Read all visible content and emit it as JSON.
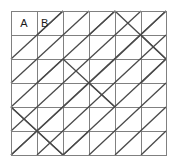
{
  "figure": {
    "kind": "geometric-grid-diagram",
    "background_color": "#ffffff",
    "grid": {
      "columns": 6,
      "rows": 6,
      "x_positions": [
        11,
        37,
        63,
        89,
        115,
        141,
        166
      ],
      "y_positions": [
        11,
        35,
        59,
        83,
        107,
        131,
        155
      ],
      "line_color": "#808080",
      "line_width": 1,
      "border_color": "#808080",
      "border_width": 1
    },
    "diagonals": {
      "line_color": "#4a4a4a",
      "line_width": 1.3,
      "segments": [
        [
          1,
          1,
          2,
          0
        ],
        [
          0,
          2,
          2,
          0
        ],
        [
          0,
          3,
          3,
          0
        ],
        [
          0,
          4,
          4,
          0
        ],
        [
          0,
          5,
          5,
          0
        ],
        [
          0,
          6,
          6,
          0
        ],
        [
          1,
          6,
          6,
          1
        ],
        [
          2,
          6,
          6,
          2
        ],
        [
          3,
          6,
          6,
          3
        ],
        [
          4,
          6,
          6,
          4
        ],
        [
          5,
          6,
          6,
          5
        ],
        [
          4,
          0,
          6,
          2
        ],
        [
          2,
          2,
          4,
          4
        ],
        [
          0,
          4,
          2,
          6
        ],
        [
          4,
          2,
          6,
          0
        ],
        [
          2,
          4,
          4,
          2
        ],
        [
          0,
          6,
          2,
          4
        ],
        [
          5,
          1,
          6,
          2
        ],
        [
          3,
          3,
          4,
          4
        ],
        [
          1,
          5,
          2,
          6
        ],
        [
          2,
          6,
          3,
          5
        ],
        [
          5,
          3,
          6,
          2
        ],
        [
          0,
          4,
          1,
          5
        ],
        [
          3,
          1,
          4,
          0
        ],
        [
          1,
          3,
          2,
          2
        ]
      ]
    },
    "labels": [
      {
        "text": "A",
        "col": 0,
        "row": 0,
        "name": "cell-label-a"
      },
      {
        "text": "B",
        "col": 1,
        "row": 0,
        "name": "cell-label-b"
      }
    ]
  }
}
